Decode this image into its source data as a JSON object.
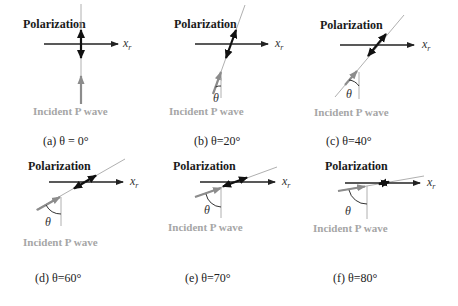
{
  "figure": {
    "polarization_label": "Polarization",
    "incident_label": "Incident P wave",
    "axis_label": "x",
    "axis_subscript": "r",
    "theta_symbol": "θ",
    "colors": {
      "axis": "#222222",
      "polarization_arrow": "#1a1a1a",
      "incident_arrow": "#8c8c8c",
      "ray_line": "#b0b0b0",
      "incident_text": "#a6a6a6"
    },
    "panels": [
      {
        "id": "a",
        "caption": "(a) θ = 0°",
        "angle_deg": 0
      },
      {
        "id": "b",
        "caption": "(b) θ=20°",
        "angle_deg": 20
      },
      {
        "id": "c",
        "caption": "(c) θ=40°",
        "angle_deg": 40
      },
      {
        "id": "d",
        "caption": "(d) θ=60°",
        "angle_deg": 60
      },
      {
        "id": "e",
        "caption": "(e) θ=70°",
        "angle_deg": 70
      },
      {
        "id": "f",
        "caption": "(f) θ=80°",
        "angle_deg": 80
      }
    ]
  }
}
